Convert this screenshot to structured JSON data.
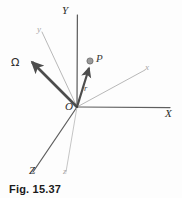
{
  "figure": {
    "caption": "Fig. 15.37",
    "colors": {
      "fixed_axis": "#5a5a5a",
      "rotating_axis": "#b0b0b0",
      "vector": "#4d4d4d",
      "point_fill": "#9a9a9a",
      "background": "#fdfdfd"
    },
    "origin_label": "O",
    "axes": [
      {
        "name": "axis-Y",
        "label": "Y",
        "kind": "fixed",
        "label_x": 62,
        "label_y": 6
      },
      {
        "name": "axis-X",
        "label": "X",
        "kind": "fixed",
        "label_x": 165,
        "label_y": 109
      },
      {
        "name": "axis-Z",
        "label": "Z",
        "kind": "fixed",
        "label_x": 29,
        "label_y": 166
      },
      {
        "name": "axis-x-small",
        "label": "x",
        "kind": "rotating",
        "label_x": 145,
        "label_y": 64
      },
      {
        "name": "axis-y-small",
        "label": "y",
        "kind": "rotating",
        "label_x": 37,
        "label_y": 26
      },
      {
        "name": "axis-z-small",
        "label": "z",
        "kind": "rotating",
        "label_x": 63,
        "label_y": 168
      }
    ],
    "vectors": [
      {
        "name": "omega-vector",
        "label": "Ω",
        "label_x": 11,
        "label_y": 58
      },
      {
        "name": "position-vector-r",
        "label": "r",
        "label_x": 84,
        "label_y": 85
      }
    ],
    "points": [
      {
        "name": "point-P",
        "label": "P",
        "label_x": 96,
        "label_y": 54,
        "cx": 90,
        "cy": 61,
        "r": 3.1
      }
    ]
  }
}
